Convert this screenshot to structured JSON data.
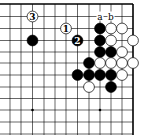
{
  "diagram": {
    "type": "go-board-corner",
    "grid": {
      "x": [
        10,
        21,
        32.5,
        44,
        55,
        66,
        77.5,
        89,
        100,
        111,
        122,
        133
      ],
      "y": [
        4,
        16.5,
        28.5,
        40.5,
        52,
        63,
        75,
        87,
        98.5,
        110,
        122,
        134
      ],
      "top_edge": true,
      "right_edge": true
    },
    "colors": {
      "line": "#000000",
      "black": "#000000",
      "white": "#ffffff",
      "background": "#ffffff"
    },
    "star_points": [
      [
        2,
        9
      ],
      [
        8,
        9
      ]
    ],
    "stones": [
      {
        "c": 2,
        "r": 1,
        "color": "white",
        "label": "3"
      },
      {
        "c": 5,
        "r": 2,
        "color": "white",
        "label": "1"
      },
      {
        "c": 2,
        "r": 3,
        "color": "black"
      },
      {
        "c": 6,
        "r": 3,
        "color": "black",
        "label": "2"
      },
      {
        "c": 8,
        "r": 2,
        "color": "black"
      },
      {
        "c": 9,
        "r": 2,
        "color": "white"
      },
      {
        "c": 10,
        "r": 2,
        "color": "white"
      },
      {
        "c": 8,
        "r": 3,
        "color": "black"
      },
      {
        "c": 9,
        "r": 3,
        "color": "white"
      },
      {
        "c": 11,
        "r": 3,
        "color": "white"
      },
      {
        "c": 8,
        "r": 4,
        "color": "black"
      },
      {
        "c": 9,
        "r": 4,
        "color": "black"
      },
      {
        "c": 10,
        "r": 4,
        "color": "white"
      },
      {
        "c": 7,
        "r": 5,
        "color": "black"
      },
      {
        "c": 8,
        "r": 5,
        "color": "white"
      },
      {
        "c": 9,
        "r": 5,
        "color": "white"
      },
      {
        "c": 10,
        "r": 5,
        "color": "white"
      },
      {
        "c": 11,
        "r": 5,
        "color": "white"
      },
      {
        "c": 6,
        "r": 6,
        "color": "black"
      },
      {
        "c": 7,
        "r": 6,
        "color": "black"
      },
      {
        "c": 8,
        "r": 6,
        "color": "black"
      },
      {
        "c": 9,
        "r": 6,
        "color": "black"
      },
      {
        "c": 10,
        "r": 6,
        "color": "white"
      },
      {
        "c": 7,
        "r": 7,
        "color": "white"
      },
      {
        "c": 9,
        "r": 7,
        "color": "black"
      }
    ],
    "point_labels": [
      {
        "c": 8,
        "r": 1,
        "text": "a"
      },
      {
        "c": 9,
        "r": 1,
        "text": "b"
      }
    ]
  }
}
